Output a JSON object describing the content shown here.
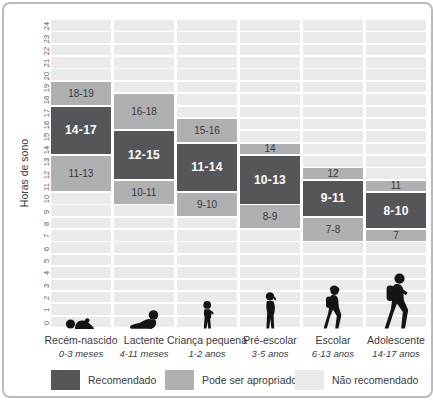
{
  "colors": {
    "recommended": "#555659",
    "appropriate": "#afb0b2",
    "not_recommended": "#eaeaeb",
    "label_on_recommended": "#ffffff",
    "label_on_appropriate": "#3a3a3c",
    "axis_text": "#55565a",
    "figure_border": "#b9babb",
    "icon": "#141414"
  },
  "chart_data": {
    "type": "stacked_range_bars",
    "title": "",
    "ylabel": "Horas de sono",
    "xlabel": "",
    "ylim": [
      0,
      24
    ],
    "yticks": [
      0,
      1,
      2,
      3,
      4,
      5,
      6,
      7,
      8,
      9,
      10,
      11,
      12,
      13,
      14,
      15,
      16,
      17,
      18,
      19,
      20,
      21,
      22,
      23,
      24
    ],
    "grid": "horizontal-white-bands",
    "legend_position": "bottom",
    "legend": [
      {
        "key": "recommended",
        "label": "Recomendado"
      },
      {
        "key": "appropriate",
        "label": "Pode ser apropriado"
      },
      {
        "key": "not_recommended",
        "label": "Não recomendado"
      }
    ],
    "groups": [
      {
        "name": "Recém-nascido",
        "age": "0-3 meses",
        "icon": "newborn-lying-icon",
        "bands": [
          {
            "key": "appropriate",
            "label": "18-19",
            "from": 18,
            "to": 19
          },
          {
            "key": "recommended",
            "label": "14-17",
            "from": 14,
            "to": 17
          },
          {
            "key": "appropriate",
            "label": "11-13",
            "from": 11,
            "to": 13
          }
        ]
      },
      {
        "name": "Lactente",
        "age": "4-11 meses",
        "icon": "crawling-baby-icon",
        "bands": [
          {
            "key": "appropriate",
            "label": "16-18",
            "from": 16,
            "to": 18
          },
          {
            "key": "recommended",
            "label": "12-15",
            "from": 12,
            "to": 15
          },
          {
            "key": "appropriate",
            "label": "10-11",
            "from": 10,
            "to": 11
          }
        ]
      },
      {
        "name": "Criança pequena",
        "age": "1-2 anos",
        "icon": "toddler-icon",
        "bands": [
          {
            "key": "appropriate",
            "label": "15-16",
            "from": 15,
            "to": 16
          },
          {
            "key": "recommended",
            "label": "11-14",
            "from": 11,
            "to": 14
          },
          {
            "key": "appropriate",
            "label": "9-10",
            "from": 9,
            "to": 10
          }
        ]
      },
      {
        "name": "Pré-escolar",
        "age": "3-5 anos",
        "icon": "preschooler-icon",
        "bands": [
          {
            "key": "appropriate",
            "label": "14",
            "from": 14,
            "to": 14
          },
          {
            "key": "recommended",
            "label": "10-13",
            "from": 10,
            "to": 13
          },
          {
            "key": "appropriate",
            "label": "8-9",
            "from": 8,
            "to": 9
          }
        ]
      },
      {
        "name": "Escolar",
        "age": "6-13 anos",
        "icon": "school-child-icon",
        "bands": [
          {
            "key": "appropriate",
            "label": "12",
            "from": 12,
            "to": 12
          },
          {
            "key": "recommended",
            "label": "9-11",
            "from": 9,
            "to": 11
          },
          {
            "key": "appropriate",
            "label": "7-8",
            "from": 7,
            "to": 8
          }
        ]
      },
      {
        "name": "Adolescente",
        "age": "14-17 anos",
        "icon": "teenager-icon",
        "bands": [
          {
            "key": "appropriate",
            "label": "11",
            "from": 11,
            "to": 11
          },
          {
            "key": "recommended",
            "label": "8-10",
            "from": 8,
            "to": 10
          },
          {
            "key": "appropriate",
            "label": "7",
            "from": 7,
            "to": 7
          }
        ]
      }
    ]
  }
}
